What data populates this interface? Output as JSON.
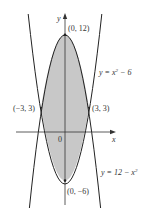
{
  "diagram": {
    "axes": {
      "x_label": "x",
      "y_label": "y",
      "origin_label": "0"
    },
    "points": [
      {
        "id": "top-vertex",
        "label": "(0, 12)"
      },
      {
        "id": "left-intersection",
        "label": "(−3, 3)"
      },
      {
        "id": "right-intersection",
        "label": "(3, 3)"
      },
      {
        "id": "bottom-vertex",
        "label": "(0, −6)"
      }
    ],
    "curves": [
      {
        "id": "upward-parabola",
        "equation": "y = x² − 6",
        "eq_prefix": "y = x",
        "eq_sup": "2",
        "eq_suffix": " − 6"
      },
      {
        "id": "downward-parabola",
        "equation": "y = 12 − x²",
        "eq_prefix": "y = 12 − x",
        "eq_sup": "2",
        "eq_suffix": ""
      }
    ],
    "colors": {
      "shade": "#c8c8c8",
      "curve": "#222222",
      "axis": "#333333"
    }
  }
}
